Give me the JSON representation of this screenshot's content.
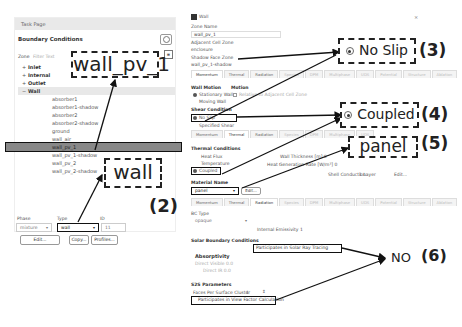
{
  "task_page": {
    "header": "Task Page",
    "title": "Boundary Conditions",
    "zone_label": "Zone",
    "zone_filter_placeholder": "Filter Text",
    "categories": [
      {
        "sign": "+",
        "label": "Inlet"
      },
      {
        "sign": "+",
        "label": "Internal"
      },
      {
        "sign": "+",
        "label": "Outlet"
      },
      {
        "sign": "−",
        "label": "Wall"
      }
    ],
    "wall_items": [
      "absorber1",
      "absorber1-shadow",
      "absorber2",
      "absorber2-shadow",
      "ground",
      "wall_air",
      "wall_pv_1",
      "wall_pv_1-shadow",
      "wall_pv_2",
      "wall_pv_2-shadow"
    ],
    "selected_item": "wall_pv_1",
    "phase_label": "Phase",
    "phase_value": "mixture",
    "type_label": "Type",
    "type_value": "wall",
    "id_label": "ID",
    "id_value": "11",
    "edit_button": "Edit...",
    "copy_button": "Copy...",
    "profiles_button": "Profiles..."
  },
  "annotations": {
    "zone_callout": "wall_pv_1",
    "type_callout": "wall",
    "label_2": "(2)",
    "noslip_callout": "No Slip",
    "label_3": "(3)",
    "coupled_callout": "Coupled",
    "label_4": "(4)",
    "panel_callout": "panel",
    "label_5": "(5)",
    "no_text": "NO",
    "label_6": "(6)"
  },
  "wall_dialog": {
    "title": "Wall",
    "close": "×",
    "zone_name_label": "Zone Name",
    "zone_name_value": "wall_pv_1",
    "adjacent_cell_zone_label": "Adjacent Cell Zone",
    "adjacent_cell_zone_value": "enclosure",
    "shadow_face_zone_label": "Shadow Face Zone",
    "shadow_face_zone_value": "wall_pv_1-shadow",
    "tabs": [
      "Momentum",
      "Thermal",
      "Radiation",
      "Species",
      "DPM",
      "Multiphase",
      "UDS",
      "Potential",
      "Structure",
      "Ablation"
    ],
    "wall_motion_label": "Wall Motion",
    "motion_label": "Motion",
    "stationary_wall": "Stationary Wall",
    "moving_wall": "Moving Wall",
    "relative_adjacent": "Relative to Adjacent Cell Zone",
    "shear_condition_label": "Shear Condition",
    "no_slip": "No Slip",
    "specified_shear": "Specified Shear",
    "thermal_conditions_label": "Thermal Conditions",
    "heat_flux": "Heat Flux",
    "temperature": "Temperature",
    "coupled": "Coupled",
    "wall_thickness_label": "Wall Thickness [m] 0",
    "heat_generation_label": "Heat Generation Rate [W/m³] 0",
    "shell_conduction_label": "Shell Conduction",
    "shell_conduction_value": "1 Layer",
    "shell_edit": "Edit...",
    "material_name_label": "Material Name",
    "material_name_value": "panel",
    "material_edit": "Edit...",
    "bc_type_label": "BC Type",
    "bc_type_value": "opaque",
    "internal_emissivity_label": "Internal Emissivity 1",
    "solar_bc_label": "Solar Boundary Conditions",
    "participates_solar": "Participates in Solar Ray Tracing",
    "absorptivity_label": "Absorptivity",
    "direct_visible_label": "Direct Visible 0.0",
    "direct_ir_label": "Direct IR 0.0",
    "s2s_label": "S2S Parameters",
    "faces_per_cluster_label": "Faces Per Surface Cluster",
    "faces_per_cluster_value": "1",
    "participates_view": "Participates in View Factor Calculation"
  }
}
